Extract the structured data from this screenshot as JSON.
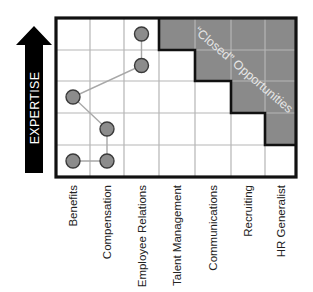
{
  "diagram": {
    "axis_label": "EXPERTISE",
    "region_label": "“Closed” Opportunities",
    "columns": [
      "Benefits",
      "Compensation",
      "Employee Relations",
      "Talent Management",
      "Communications",
      "Recruiting",
      "HR Generalist"
    ],
    "rows": 5,
    "closed_region": [
      {
        "row": 0,
        "from_col": 3
      },
      {
        "row": 1,
        "from_col": 4
      },
      {
        "row": 2,
        "from_col": 5
      },
      {
        "row": 3,
        "from_col": 6
      }
    ],
    "path_points": [
      {
        "col": 0,
        "row": 4
      },
      {
        "col": 1,
        "row": 4
      },
      {
        "col": 1,
        "row": 3
      },
      {
        "col": 0,
        "row": 2
      },
      {
        "col": 2,
        "row": 1
      },
      {
        "col": 2,
        "row": 0
      }
    ],
    "colors": {
      "shade": "#8a8a8a",
      "grid": "#b5b5b5",
      "border": "#111111",
      "node": "#8c8c8c",
      "arrow": "#000000",
      "region_text": "#e6e6e6"
    }
  }
}
